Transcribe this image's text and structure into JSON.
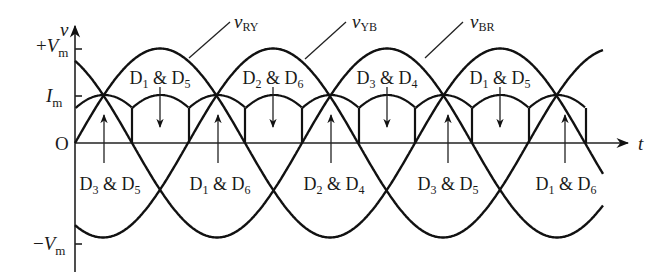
{
  "diagram": {
    "axes": {
      "y_label": "v",
      "x_label": "t",
      "ticks": [
        {
          "id": "vm_pos",
          "label_sign": "+",
          "label_main": "V",
          "label_sub": "m"
        },
        {
          "id": "im",
          "label_sign": "",
          "label_main": "I",
          "label_sub": "m"
        },
        {
          "id": "origin",
          "label_sign": "",
          "label_main": "O",
          "label_sub": ""
        },
        {
          "id": "vm_neg",
          "label_sign": "−",
          "label_main": "V",
          "label_sub": "m"
        }
      ]
    },
    "waveforms": [
      {
        "main": "v",
        "sub": "RY"
      },
      {
        "main": "v",
        "sub": "YB"
      },
      {
        "main": "v",
        "sub": "BR"
      }
    ],
    "conduction_top": [
      {
        "a": "1",
        "b": "5"
      },
      {
        "a": "2",
        "b": "6"
      },
      {
        "a": "3",
        "b": "4"
      },
      {
        "a": "1",
        "b": "5"
      }
    ],
    "conduction_bottom": [
      {
        "a": "3",
        "b": "5"
      },
      {
        "a": "1",
        "b": "6"
      },
      {
        "a": "2",
        "b": "4"
      },
      {
        "a": "3",
        "b": "5"
      },
      {
        "a": "1",
        "b": "6"
      }
    ],
    "diode_prefix": "D",
    "ampersand": "&",
    "colors": {
      "line": "#111111",
      "background": "#ffffff"
    }
  }
}
